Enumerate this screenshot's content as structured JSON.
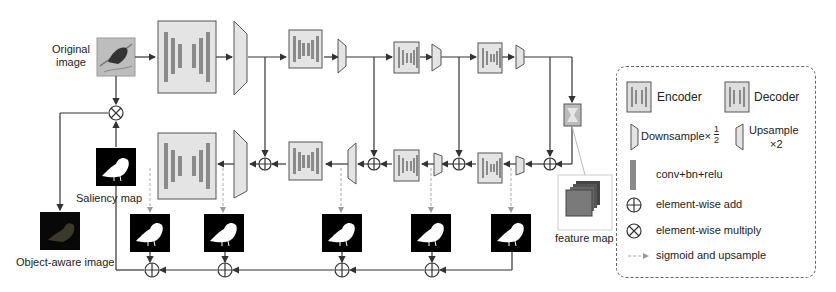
{
  "diagram": {
    "labels": {
      "original_image": "Original\nimage",
      "original_image_line1": "Original",
      "original_image_line2": "image",
      "saliency_map": "Saliency map",
      "object_aware_image": "Object-aware image",
      "feature_map": "feature map"
    },
    "encoder_stages": 5,
    "decoder_stages": 4,
    "side_outputs": 5,
    "colors": {
      "block_fill": "#e4e4e4",
      "block_border": "#555555",
      "conv_bar": "#8a8a8a",
      "line": "#333333",
      "dashed_arrow": "#aaaaaa",
      "map_bg": "#000000",
      "legend_border": "#666666"
    }
  },
  "legend": {
    "encoder": "Encoder",
    "decoder": "Decoder",
    "downsample": "Downsample×",
    "downsample_frac_num": "1",
    "downsample_frac_den": "2",
    "upsample": "Upsample",
    "upsample_factor": "×2",
    "conv": "conv+bn+relu",
    "add": "element-wise add",
    "multiply": "element-wise multiply",
    "sigmoid": "sigmoid and upsample"
  }
}
